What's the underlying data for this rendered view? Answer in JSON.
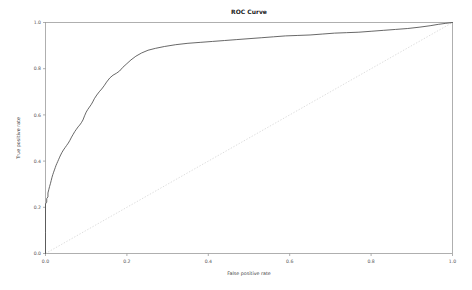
{
  "chart_data": {
    "type": "line",
    "title": "ROC Curve",
    "xlabel": "False positive rate",
    "ylabel": "True positive rate",
    "xlim": [
      0.0,
      1.0
    ],
    "ylim": [
      0.0,
      1.0
    ],
    "grid": false,
    "legend": null,
    "xticks": [
      "0.0",
      "0.2",
      "0.4",
      "0.6",
      "0.8",
      "1.0"
    ],
    "xtick_values": [
      0.0,
      0.2,
      0.4,
      0.6,
      0.8,
      1.0
    ],
    "yticks": [
      "0.0",
      "0.2",
      "0.4",
      "0.6",
      "0.8",
      "1.0"
    ],
    "ytick_values": [
      0.0,
      0.2,
      0.4,
      0.6,
      0.8,
      1.0
    ],
    "series": [
      {
        "name": "ROC curve",
        "style": "solid",
        "color": "#4d4d4d",
        "x": [
          0.0,
          0.0,
          0.0,
          0.003,
          0.003,
          0.006,
          0.006,
          0.008,
          0.01,
          0.012,
          0.014,
          0.016,
          0.018,
          0.02,
          0.022,
          0.024,
          0.026,
          0.028,
          0.03,
          0.032,
          0.034,
          0.036,
          0.04,
          0.044,
          0.048,
          0.052,
          0.056,
          0.06,
          0.064,
          0.068,
          0.072,
          0.076,
          0.08,
          0.084,
          0.088,
          0.092,
          0.096,
          0.1,
          0.104,
          0.108,
          0.112,
          0.116,
          0.12,
          0.126,
          0.132,
          0.138,
          0.144,
          0.15,
          0.158,
          0.166,
          0.174,
          0.182,
          0.19,
          0.2,
          0.21,
          0.222,
          0.236,
          0.252,
          0.27,
          0.292,
          0.32,
          0.35,
          0.38,
          0.41,
          0.44,
          0.47,
          0.5,
          0.53,
          0.56,
          0.59,
          0.62,
          0.65,
          0.68,
          0.71,
          0.74,
          0.77,
          0.8,
          0.83,
          0.86,
          0.89,
          0.92,
          0.945,
          0.965,
          0.982,
          1.0
        ],
        "y": [
          0.0,
          0.09,
          0.215,
          0.222,
          0.238,
          0.245,
          0.262,
          0.276,
          0.29,
          0.302,
          0.316,
          0.33,
          0.342,
          0.352,
          0.362,
          0.372,
          0.382,
          0.39,
          0.398,
          0.406,
          0.414,
          0.422,
          0.436,
          0.448,
          0.458,
          0.468,
          0.478,
          0.49,
          0.504,
          0.516,
          0.528,
          0.538,
          0.548,
          0.556,
          0.566,
          0.578,
          0.596,
          0.612,
          0.624,
          0.634,
          0.644,
          0.656,
          0.67,
          0.686,
          0.7,
          0.712,
          0.726,
          0.742,
          0.76,
          0.772,
          0.78,
          0.79,
          0.806,
          0.822,
          0.838,
          0.854,
          0.868,
          0.88,
          0.888,
          0.896,
          0.904,
          0.91,
          0.914,
          0.918,
          0.922,
          0.926,
          0.93,
          0.934,
          0.938,
          0.942,
          0.944,
          0.946,
          0.95,
          0.954,
          0.956,
          0.958,
          0.962,
          0.966,
          0.97,
          0.974,
          0.98,
          0.986,
          0.992,
          0.996,
          1.0
        ]
      },
      {
        "name": "chance",
        "style": "dotted",
        "color": "#cfcfcf",
        "x": [
          0.0,
          1.0
        ],
        "y": [
          0.0,
          1.0
        ]
      }
    ]
  }
}
